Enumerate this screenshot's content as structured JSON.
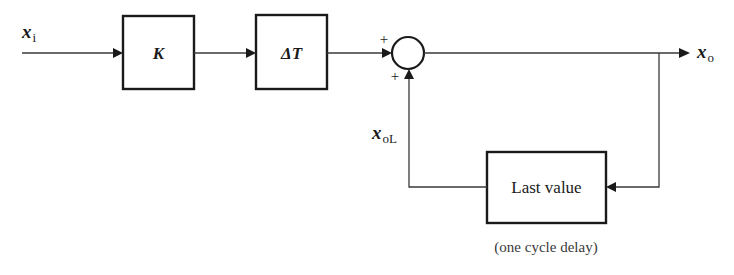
{
  "diagram": {
    "type": "block-diagram",
    "signals": {
      "input": {
        "name": "x",
        "subscript": "i"
      },
      "output": {
        "name": "x",
        "subscript": "o"
      },
      "feedback": {
        "name": "x",
        "subscript": "oL"
      }
    },
    "blocks": [
      {
        "id": "gain",
        "label": "K"
      },
      {
        "id": "delta_t",
        "label": "ΔT"
      },
      {
        "id": "last_value",
        "label": "Last value",
        "caption": "(one cycle delay)"
      }
    ],
    "summing_junction": {
      "signs": {
        "top_input": "+",
        "bottom_input": "+"
      }
    },
    "connections": [
      {
        "from": "x_i",
        "to": "gain"
      },
      {
        "from": "gain",
        "to": "delta_t"
      },
      {
        "from": "delta_t",
        "to": "summing_junction",
        "sign": "+"
      },
      {
        "from": "summing_junction",
        "to": "x_o"
      },
      {
        "from": "x_o",
        "to": "last_value"
      },
      {
        "from": "last_value",
        "to": "summing_junction",
        "sign": "+",
        "label": "x_oL"
      }
    ]
  }
}
